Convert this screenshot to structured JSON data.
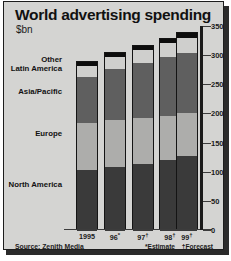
{
  "figure": {
    "title": "World advertising spending",
    "subtitle": "$bn",
    "source": "Source: Zenith Media",
    "note_estimate": "*Estimate",
    "note_forecast": "†Forecast"
  },
  "axis": {
    "ticks": [
      "350",
      "300",
      "250",
      "200",
      "150",
      "100",
      "50",
      "0"
    ]
  },
  "categories_labels": {
    "other": "Other",
    "latin_america": "Latin America",
    "asia_pacific": "Asia/Pacific",
    "europe": "Europe",
    "north_america": "North America"
  },
  "xlabels": [
    {
      "text": "1995",
      "mark": ""
    },
    {
      "text": "96",
      "mark": "*"
    },
    {
      "text": "97",
      "mark": "†"
    },
    {
      "text": "98",
      "mark": "†"
    },
    {
      "text": "99",
      "mark": "†"
    }
  ],
  "colors": {
    "north_america": "#3a3a3a",
    "europe": "#adadab",
    "asia_pacific": "#5f5f5f",
    "latin_america": "#cfcfcd",
    "other": "#0d0d0d",
    "panel_background": "#d4d4d2",
    "axis": "#1a1a1a"
  },
  "chart_data": {
    "type": "bar",
    "title": "World advertising spending",
    "subtitle": "$bn",
    "xlabel": "",
    "ylabel": "$bn",
    "ylim": [
      0,
      350
    ],
    "yticks": [
      0,
      50,
      100,
      150,
      200,
      250,
      300,
      350
    ],
    "grid": false,
    "stacked": true,
    "legend_position": "left-axis-labels",
    "categories": [
      "1995",
      "96*",
      "97†",
      "98†",
      "99†"
    ],
    "series": [
      {
        "name": "North America",
        "values": [
          105,
          110,
          115,
          122,
          128
        ]
      },
      {
        "name": "Europe",
        "values": [
          80,
          80,
          78,
          76,
          75
        ]
      },
      {
        "name": "Asia/Pacific",
        "values": [
          80,
          88,
          95,
          100,
          103
        ]
      },
      {
        "name": "Latin America",
        "values": [
          18,
          20,
          22,
          24,
          26
        ]
      },
      {
        "name": "Other",
        "values": [
          7,
          7,
          8,
          8,
          8
        ]
      }
    ],
    "totals": [
      290,
      305,
      318,
      330,
      340
    ],
    "annotations": [
      "*Estimate",
      "†Forecast"
    ],
    "source": "Source: Zenith Media"
  }
}
